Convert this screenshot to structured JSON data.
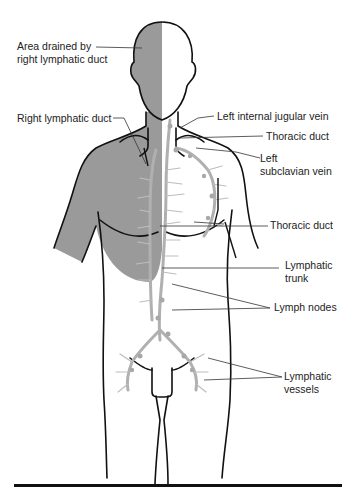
{
  "figure": {
    "colors": {
      "shaded_region": "#9a9a9a",
      "lymph_vessels": "#b0b0b0",
      "outline": "#111111",
      "leader_line": "#333333"
    }
  },
  "labels": {
    "area_drained": {
      "line1": "Area drained by",
      "line2": "right lymphatic duct"
    },
    "right_lymphatic_duct": "Right lymphatic duct",
    "left_internal_jugular_vein": "Left internal jugular vein",
    "thoracic_duct_upper": "Thoracic duct",
    "left_subclavian_vein": {
      "line1": "Left",
      "line2": "subclavian vein"
    },
    "thoracic_duct_lower": "Thoracic duct",
    "lymphatic_trunk": {
      "line1": "Lymphatic",
      "line2": "trunk"
    },
    "lymph_nodes": "Lymph nodes",
    "lymphatic_vessels": {
      "line1": "Lymphatic",
      "line2": "vessels"
    }
  }
}
